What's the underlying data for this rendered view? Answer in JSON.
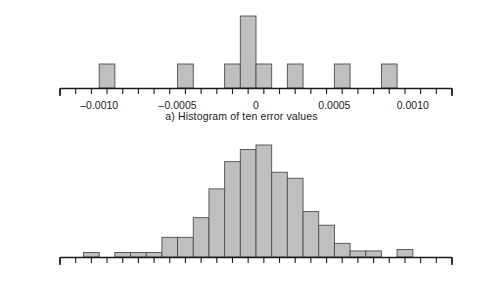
{
  "figure": {
    "background": "#ffffff",
    "bar_fill": "#bfbfbf",
    "bar_stroke": "#4d4d4d",
    "axis_color": "#1a1a1a"
  },
  "axis": {
    "xmin": -0.00125,
    "xmax": 0.00125,
    "major_ticks": [
      -0.001,
      -0.0005,
      0,
      0.0005,
      0.001
    ],
    "major_tick_labels": [
      "–0.0010",
      "–0.0005",
      "0",
      "0.0005",
      "0.0010"
    ],
    "minor_tick_step": 0.0001,
    "bin_width": 0.0001,
    "grid": false
  },
  "panels": [
    {
      "id": "a",
      "caption": "a) Histogram of ten error values",
      "chart_index": 0
    },
    {
      "id": "b",
      "caption": "b) Histogram of 500 error values",
      "chart_index": 1
    }
  ],
  "chart_data": [
    {
      "type": "bar",
      "title": "a) Histogram of ten error values",
      "xlabel": "",
      "ylabel": "",
      "xlim": [
        -0.00125,
        0.00125
      ],
      "ylim": [
        0,
        3
      ],
      "grid": false,
      "legend": "none",
      "bin_width": 0.0001,
      "bin_centers": [
        -0.00105,
        -0.00095,
        -0.00085,
        -0.00075,
        -0.00065,
        -0.00055,
        -0.00045,
        -0.00035,
        -0.00025,
        -0.00015,
        -5e-05,
        5e-05,
        0.00015,
        0.00025,
        0.00035,
        0.00045,
        0.00055,
        0.00065,
        0.00075,
        0.00085,
        0.00095,
        0.00105,
        0.00115
      ],
      "values": [
        0,
        1,
        0,
        0,
        0,
        0,
        1,
        0,
        0,
        1,
        3,
        1,
        0,
        1,
        0,
        0,
        1,
        0,
        0,
        1,
        0,
        0,
        0
      ],
      "categories": [
        "–0.00105",
        "–0.00095",
        "–0.00085",
        "–0.00075",
        "–0.00065",
        "–0.00055",
        "–0.00045",
        "–0.00035",
        "–0.00025",
        "–0.00015",
        "–0.00005",
        "0.00005",
        "0.00015",
        "0.00025",
        "0.00035",
        "0.00045",
        "0.00055",
        "0.00065",
        "0.00075",
        "0.00085",
        "0.00095",
        "0.00105",
        "0.00115"
      ]
    },
    {
      "type": "bar",
      "title": "b) Histogram of 500 error values",
      "xlabel": "",
      "ylabel": "",
      "xlim": [
        -0.00125,
        0.00125
      ],
      "ylim": [
        0,
        74
      ],
      "grid": false,
      "legend": "none",
      "bin_width": 0.0001,
      "bin_centers": [
        -0.00115,
        -0.00105,
        -0.00095,
        -0.00085,
        -0.00075,
        -0.00065,
        -0.00055,
        -0.00045,
        -0.00035,
        -0.00025,
        -0.00015,
        -5e-05,
        5e-05,
        0.00015,
        0.00025,
        0.00035,
        0.00045,
        0.00055,
        0.00065,
        0.00075,
        0.00085,
        0.00095,
        0.00105,
        0.00115
      ],
      "values": [
        0,
        3,
        0,
        3,
        3,
        3,
        13,
        13,
        26,
        45,
        63,
        71,
        74,
        56,
        52,
        30,
        21,
        9,
        4,
        4,
        0,
        5,
        0,
        0
      ],
      "categories": [
        "–0.00115",
        "–0.00105",
        "–0.00095",
        "–0.00085",
        "–0.00075",
        "–0.00065",
        "–0.00055",
        "–0.00045",
        "–0.00035",
        "–0.00025",
        "–0.00015",
        "–0.00005",
        "0.00005",
        "0.00015",
        "0.00025",
        "0.00035",
        "0.00045",
        "0.00055",
        "0.00065",
        "0.00075",
        "0.00085",
        "0.00095",
        "0.00105",
        "0.00115"
      ]
    }
  ]
}
